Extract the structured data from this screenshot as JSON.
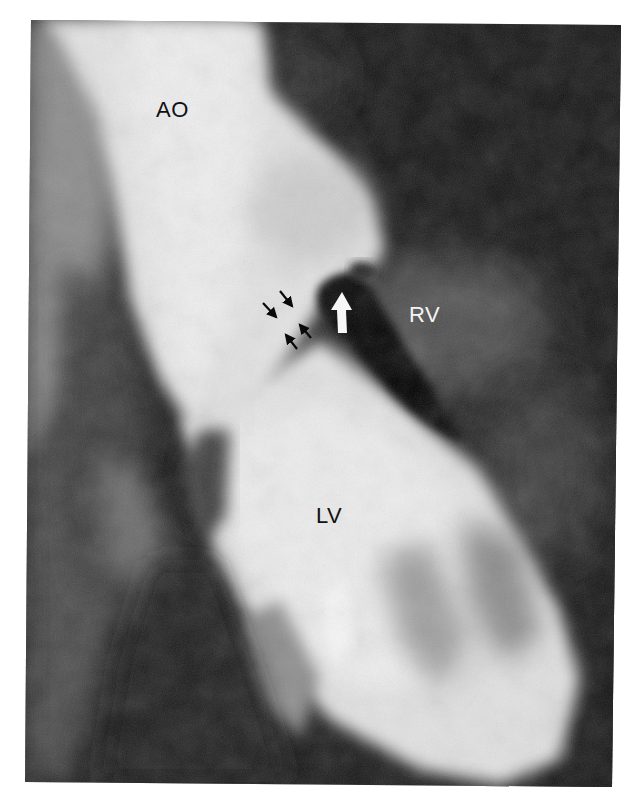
{
  "figure": {
    "type": "grayscale left ventriculogram / angiogram",
    "labels": {
      "aorta": "AO",
      "right_ventricle": "RV",
      "left_ventricle": "LV"
    },
    "annotations": {
      "black_arrows_count": 4,
      "white_arrow_count": 1,
      "white_arrow_direction": "up",
      "black_arrows_direction": "converging on jet between AO and RV"
    },
    "colors": {
      "background_border": "#ffffff",
      "dark_tissue": "#101010",
      "contrast_opacified": "#eeeeee",
      "label_dark": "#111111",
      "label_light": "#f4f4f4"
    }
  }
}
